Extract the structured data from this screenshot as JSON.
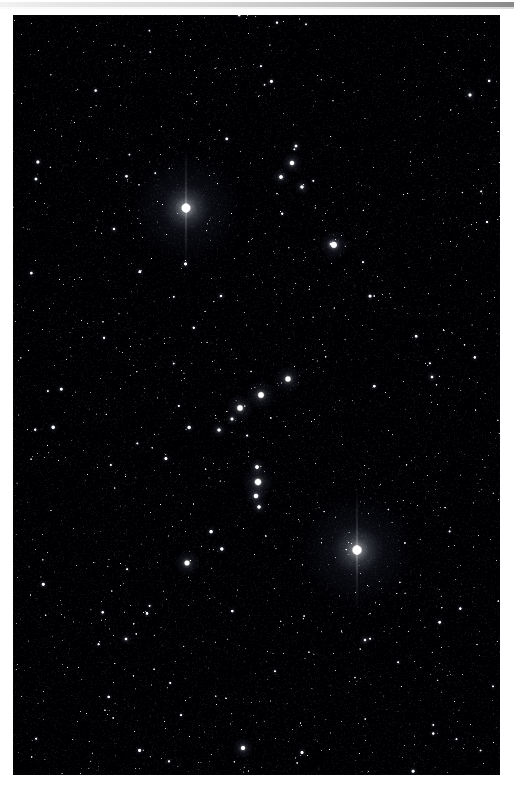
{
  "image": {
    "title": "Orion Constellation",
    "medium": "astronomical photograph",
    "frame": {
      "page_width": 514,
      "page_height": 790,
      "border_color": "#ffffff",
      "sky_left": 13,
      "sky_top": 15,
      "sky_width": 487,
      "sky_height": 760,
      "sky_color": "#050508",
      "scan_band_color": "#c9c9c9"
    }
  },
  "chart_data": {
    "type": "scatter",
    "xlabel": "",
    "ylabel": "",
    "xlim": [
      0,
      487
    ],
    "ylim": [
      0,
      760
    ],
    "grid": false,
    "legend": "none",
    "background": "#040406",
    "star_color": "#ffffff",
    "named_stars": [
      {
        "name": "Betelgeuse",
        "x": 173,
        "y": 193,
        "mag": 1.0,
        "radius": 5.2,
        "glow": 26,
        "tint": "#fff4e6"
      },
      {
        "name": "Rigel",
        "x": 344,
        "y": 535,
        "mag": 1.0,
        "radius": 5.4,
        "glow": 27,
        "tint": "#eef4ff"
      },
      {
        "name": "Bellatrix",
        "x": 321,
        "y": 230,
        "mag": 0.72,
        "radius": 3.6,
        "glow": 15,
        "tint": "#eef3ff"
      },
      {
        "name": "Saiph",
        "x": 174,
        "y": 548,
        "mag": 0.66,
        "radius": 3.2,
        "glow": 13,
        "tint": "#eef3ff"
      },
      {
        "name": "Alnitak",
        "x": 227,
        "y": 393,
        "mag": 0.78,
        "radius": 3.6,
        "glow": 14,
        "tint": "#f0f4ff"
      },
      {
        "name": "Alnilam",
        "x": 248,
        "y": 380,
        "mag": 0.8,
        "radius": 3.7,
        "glow": 15,
        "tint": "#f2f5ff"
      },
      {
        "name": "Mintaka",
        "x": 275,
        "y": 364,
        "mag": 0.74,
        "radius": 3.4,
        "glow": 14,
        "tint": "#f0f4ff"
      },
      {
        "name": "Meissa",
        "x": 279,
        "y": 148,
        "mag": 0.56,
        "radius": 2.8,
        "glow": 11,
        "tint": "#f4f6ff"
      },
      {
        "name": "Phi-1 Orionis",
        "x": 268,
        "y": 162,
        "mag": 0.44,
        "radius": 2.3,
        "glow": 9,
        "tint": "#f4f6ff"
      },
      {
        "name": "Phi-2 Orionis",
        "x": 289,
        "y": 172,
        "mag": 0.4,
        "radius": 2.1,
        "glow": 8,
        "tint": "#f4f6ff"
      },
      {
        "name": "Orion Nebula",
        "x": 245,
        "y": 467,
        "mag": 0.78,
        "radius": 4.0,
        "glow": 16,
        "tint": "#f6f2ff"
      },
      {
        "name": "42 Orionis",
        "x": 244,
        "y": 452,
        "mag": 0.46,
        "radius": 2.3,
        "glow": 9,
        "tint": "#f2f4ff"
      },
      {
        "name": "Iota Orionis",
        "x": 243,
        "y": 481,
        "mag": 0.58,
        "radius": 2.8,
        "glow": 11,
        "tint": "#f2f4ff"
      },
      {
        "name": "Sword tip",
        "x": 246,
        "y": 492,
        "mag": 0.42,
        "radius": 2.2,
        "glow": 8,
        "tint": "#f2f4ff"
      },
      {
        "name": "Eta Orionis",
        "x": 206,
        "y": 415,
        "mag": 0.4,
        "radius": 2.1,
        "glow": 8,
        "tint": "#eef3ff"
      },
      {
        "name": "Sigma Orionis",
        "x": 219,
        "y": 404,
        "mag": 0.36,
        "radius": 1.9,
        "glow": 7,
        "tint": "#eef3ff"
      },
      {
        "name": "Pi-3 Orionis",
        "x": 321,
        "y": 229,
        "mag": 0.3,
        "radius": 1.7,
        "glow": 6,
        "tint": "#eef3ff"
      },
      {
        "name": "Tabit",
        "x": 230,
        "y": 733,
        "mag": 0.54,
        "radius": 2.6,
        "glow": 11,
        "tint": "#f4f4ff"
      },
      {
        "name": "Field star A",
        "x": 318,
        "y": 229,
        "mag": 0.28,
        "radius": 1.6,
        "glow": 6,
        "tint": "#ffffff"
      },
      {
        "name": "Field star B",
        "x": 457,
        "y": 80,
        "mag": 0.38,
        "radius": 2.0,
        "glow": 7,
        "tint": "#ffffff"
      },
      {
        "name": "Field star C",
        "x": 283,
        "y": 131,
        "mag": 0.34,
        "radius": 1.8,
        "glow": 6,
        "tint": "#ffffff"
      },
      {
        "name": "Field star D",
        "x": 113,
        "y": 624,
        "mag": 0.3,
        "radius": 1.7,
        "glow": 6,
        "tint": "#ffffff"
      },
      {
        "name": "Field star E",
        "x": 419,
        "y": 362,
        "mag": 0.3,
        "radius": 1.7,
        "glow": 6,
        "tint": "#ffffff"
      },
      {
        "name": "Field star F",
        "x": 101,
        "y": 214,
        "mag": 0.26,
        "radius": 1.5,
        "glow": 5,
        "tint": "#ffffff"
      },
      {
        "name": "Field star G",
        "x": 352,
        "y": 625,
        "mag": 0.28,
        "radius": 1.6,
        "glow": 6,
        "tint": "#ffffff"
      },
      {
        "name": "Field star H",
        "x": 208,
        "y": 281,
        "mag": 0.26,
        "radius": 1.5,
        "glow": 5,
        "tint": "#ffffff"
      }
    ],
    "background_star_count": 2600,
    "background_star_seed": 20240117
  }
}
